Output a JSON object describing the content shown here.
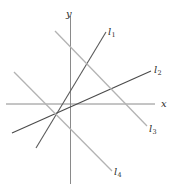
{
  "figure": {
    "width": 177,
    "height": 193,
    "background": "#ffffff"
  },
  "axes": {
    "x_label": "x",
    "y_label": "y",
    "color": "#8a8a8a",
    "origin": {
      "x": 70.5,
      "y": 104
    },
    "x_axis": {
      "x1": 6,
      "y1": 104,
      "x2": 155,
      "y2": 104
    },
    "y_axis": {
      "x1": 70.5,
      "y1": 16,
      "x2": 70.5,
      "y2": 184
    },
    "x_label_pos": {
      "x": 161,
      "y": 99
    },
    "y_label_pos": {
      "x": 66,
      "y": 9
    }
  },
  "lines": [
    {
      "name": "l1",
      "label": "l",
      "subscript": "1",
      "color": "#5a5a5a",
      "width": 1.1,
      "x1": 36,
      "y1": 148,
      "x2": 106,
      "y2": 32,
      "label_pos": {
        "x": 108,
        "y": 27
      }
    },
    {
      "name": "l2",
      "label": "l",
      "subscript": "2",
      "color": "#4a4a4a",
      "width": 1.1,
      "x1": 12,
      "y1": 133,
      "x2": 151,
      "y2": 71,
      "label_pos": {
        "x": 154,
        "y": 65
      }
    },
    {
      "name": "l3",
      "label": "l",
      "subscript": "3",
      "color": "#b3b3b3",
      "width": 1.3,
      "x1": 55,
      "y1": 31,
      "x2": 147,
      "y2": 126,
      "label_pos": {
        "x": 149,
        "y": 124
      }
    },
    {
      "name": "l4",
      "label": "l",
      "subscript": "4",
      "color": "#b3b3b3",
      "width": 1.3,
      "x1": 14,
      "y1": 72,
      "x2": 112,
      "y2": 171,
      "label_pos": {
        "x": 114,
        "y": 167
      }
    }
  ],
  "chart_data": {
    "type": "line",
    "xlabel": "x",
    "ylabel": "y",
    "grid": false,
    "legend": "inline-endpoint-labels",
    "series": [
      {
        "name": "l1",
        "slope": "positive-steep",
        "points": [
          [
            36,
            148
          ],
          [
            106,
            32
          ]
        ]
      },
      {
        "name": "l2",
        "slope": "positive-shallow",
        "points": [
          [
            12,
            133
          ],
          [
            151,
            71
          ]
        ]
      },
      {
        "name": "l3",
        "slope": "negative",
        "points": [
          [
            55,
            31
          ],
          [
            147,
            126
          ]
        ]
      },
      {
        "name": "l4",
        "slope": "negative",
        "points": [
          [
            14,
            72
          ],
          [
            112,
            171
          ]
        ]
      }
    ],
    "axes": {
      "x_axis": [
        [
          6,
          104
        ],
        [
          155,
          104
        ]
      ],
      "y_axis": [
        [
          70.5,
          16
        ],
        [
          70.5,
          184
        ]
      ]
    }
  }
}
